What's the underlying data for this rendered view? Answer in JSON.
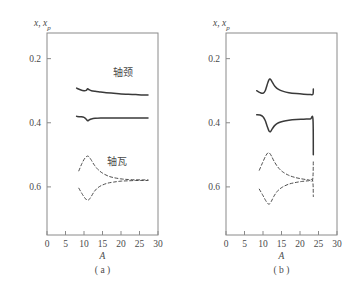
{
  "figure": {
    "background": "#ffffff",
    "axis_color": "#8a8a8a",
    "curve_color": "#3a3a3a",
    "text_color": "#4a4a4a"
  },
  "axis_labels": {
    "y_main": "x",
    "y_sep": ", ",
    "y_sub_main": "x",
    "y_sub": "p",
    "x": "A"
  },
  "captions": {
    "panel_a": "( a )",
    "panel_b": "( b )"
  },
  "annotations": {
    "journal": "轴颈",
    "bearing": "轴瓦"
  },
  "ticks": {
    "y": [
      "0.6",
      "0.4",
      "0.2"
    ],
    "x": [
      "0",
      "5",
      "10",
      "15",
      "20",
      "25",
      "30"
    ]
  },
  "chart_data": {
    "type": "line",
    "title": "",
    "xlabel": "A",
    "ylabel": "x, xp",
    "xlim": [
      0,
      30
    ],
    "ylim": [
      0.05,
      0.68
    ],
    "xticks": [
      0,
      5,
      10,
      15,
      20,
      25,
      30
    ],
    "yticks": [
      0.2,
      0.4,
      0.6
    ],
    "grid": false,
    "legend": "inline-annotations",
    "panels": [
      {
        "caption": "( a )",
        "annotations": [
          {
            "text": "轴颈",
            "x": 20.5,
            "y": 0.545
          },
          {
            "text": "轴瓦",
            "x": 19.0,
            "y": 0.268
          }
        ],
        "series": [
          {
            "name": "journal-upper",
            "style": "solid",
            "x": [
              8.0,
              9.0,
              10.0,
              10.6,
              11.0,
              11.4,
              12.0,
              13.0,
              14.5,
              16.0,
              18.0,
              20.0,
              22.0,
              24.0,
              26.0,
              27.3
            ],
            "y": [
              0.508,
              0.503,
              0.5,
              0.501,
              0.506,
              0.503,
              0.5,
              0.498,
              0.496,
              0.494,
              0.492,
              0.49,
              0.489,
              0.488,
              0.487,
              0.487
            ]
          },
          {
            "name": "journal-lower",
            "style": "solid",
            "x": [
              8.0,
              9.0,
              10.0,
              10.6,
              11.0,
              11.4,
              12.0,
              13.0,
              14.5,
              16.0,
              18.0,
              20.0,
              22.0,
              24.0,
              26.0,
              27.3
            ],
            "y": [
              0.42,
              0.419,
              0.417,
              0.411,
              0.406,
              0.409,
              0.412,
              0.414,
              0.415,
              0.415,
              0.415,
              0.415,
              0.415,
              0.415,
              0.415,
              0.415
            ]
          },
          {
            "name": "bearing-upper",
            "style": "dashed",
            "x": [
              8.6,
              9.4,
              10.2,
              10.9,
              11.4,
              12.0,
              12.8,
              13.8,
              15.0,
              16.5,
              18.0,
              20.0,
              22.0,
              24.0,
              26.0,
              27.3
            ],
            "y": [
              0.25,
              0.272,
              0.289,
              0.296,
              0.293,
              0.283,
              0.268,
              0.254,
              0.243,
              0.234,
              0.229,
              0.225,
              0.223,
              0.222,
              0.222,
              0.222
            ]
          },
          {
            "name": "bearing-lower",
            "style": "dashed",
            "x": [
              8.6,
              9.4,
              10.2,
              10.9,
              11.4,
              12.0,
              12.8,
              13.8,
              15.0,
              16.5,
              18.0,
              20.0,
              22.0,
              24.0,
              26.0,
              27.3
            ],
            "y": [
              0.196,
              0.18,
              0.166,
              0.158,
              0.161,
              0.171,
              0.186,
              0.198,
              0.206,
              0.212,
              0.215,
              0.218,
              0.219,
              0.22,
              0.22,
              0.22
            ]
          }
        ]
      },
      {
        "caption": "( b )",
        "annotations": [],
        "series": [
          {
            "name": "journal-upper",
            "style": "solid",
            "x": [
              8.3,
              9.2,
              10.0,
              10.6,
              11.1,
              11.6,
              12.0,
              12.5,
              13.2,
              14.2,
              15.5,
              17.0,
              19.0,
              21.0,
              22.8,
              23.5,
              23.6
            ],
            "y": [
              0.5,
              0.494,
              0.492,
              0.5,
              0.518,
              0.534,
              0.536,
              0.527,
              0.514,
              0.504,
              0.498,
              0.494,
              0.491,
              0.489,
              0.488,
              0.489,
              0.505
            ]
          },
          {
            "name": "journal-lower",
            "style": "solid",
            "x": [
              8.3,
              9.2,
              10.0,
              10.6,
              11.1,
              11.6,
              12.0,
              12.5,
              13.2,
              14.2,
              15.5,
              17.0,
              19.0,
              21.0,
              22.8,
              23.5,
              23.6
            ],
            "y": [
              0.425,
              0.424,
              0.419,
              0.407,
              0.39,
              0.375,
              0.372,
              0.381,
              0.392,
              0.4,
              0.405,
              0.408,
              0.41,
              0.411,
              0.412,
              0.412,
              0.3
            ]
          },
          {
            "name": "bearing-upper",
            "style": "dashed",
            "x": [
              9.0,
              9.9,
              10.7,
              11.3,
              11.8,
              12.3,
              13.0,
              14.0,
              15.2,
              16.8,
              18.5,
              20.5,
              22.3,
              23.4,
              23.6
            ],
            "y": [
              0.252,
              0.276,
              0.296,
              0.306,
              0.305,
              0.296,
              0.28,
              0.262,
              0.248,
              0.237,
              0.23,
              0.225,
              0.222,
              0.222,
              0.285
            ]
          },
          {
            "name": "bearing-lower",
            "style": "dashed",
            "x": [
              9.0,
              9.9,
              10.7,
              11.3,
              11.8,
              12.3,
              13.0,
              14.0,
              15.2,
              16.8,
              18.5,
              20.5,
              22.3,
              23.4,
              23.6
            ],
            "y": [
              0.193,
              0.175,
              0.158,
              0.148,
              0.147,
              0.156,
              0.172,
              0.188,
              0.199,
              0.208,
              0.213,
              0.217,
              0.219,
              0.22,
              0.17
            ]
          }
        ]
      }
    ]
  }
}
